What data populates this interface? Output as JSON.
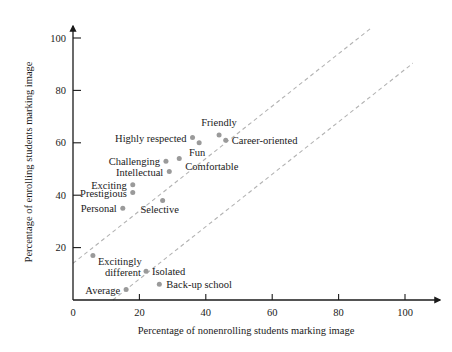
{
  "chart_data": {
    "type": "scatter",
    "title": "",
    "xlabel": "Percentage of nonenrolling students marking image",
    "ylabel": "Percentage of enrolling students marking image",
    "xlim": [
      0,
      100
    ],
    "ylim": [
      0,
      100
    ],
    "xticks": [
      "0",
      "20",
      "40",
      "60",
      "80",
      "100"
    ],
    "yticks": [
      "20",
      "40",
      "60",
      "80",
      "100"
    ],
    "xtick_values": [
      0,
      20,
      40,
      60,
      80,
      100
    ],
    "ytick_values": [
      20,
      40,
      60,
      80,
      100
    ],
    "grid": false,
    "legend": "none",
    "marker_color": "#9a9a9a",
    "reference_line_color": "#b3b3b3",
    "axis_color": "#1a1a1a",
    "points": [
      {
        "label": "Friendly",
        "x": 44,
        "y": 63,
        "label_dx": 0,
        "label_dy": -9,
        "anchor": "middle"
      },
      {
        "label": "Career-oriented",
        "x": 46,
        "y": 61,
        "label_dx": 6,
        "label_dy": 4,
        "anchor": "start"
      },
      {
        "label": "Highly respected",
        "x": 36,
        "y": 62,
        "label_dx": -6,
        "label_dy": 4,
        "anchor": "end"
      },
      {
        "label": "Fun",
        "x": 38,
        "y": 60,
        "label_dx": -2,
        "label_dy": 13,
        "anchor": "middle"
      },
      {
        "label": "Comfortable",
        "x": 32,
        "y": 54,
        "label_dx": 6,
        "label_dy": 11,
        "anchor": "start"
      },
      {
        "label": "Challenging",
        "x": 28,
        "y": 53,
        "label_dx": -6,
        "label_dy": 4,
        "anchor": "end"
      },
      {
        "label": "Intellectual",
        "x": 29,
        "y": 49,
        "label_dx": -6,
        "label_dy": 4,
        "anchor": "end"
      },
      {
        "label": "Exciting",
        "x": 18,
        "y": 44,
        "label_dx": -6,
        "label_dy": 4,
        "anchor": "end"
      },
      {
        "label": "Prestigious",
        "x": 18,
        "y": 41,
        "label_dx": -6,
        "label_dy": 4,
        "anchor": "end"
      },
      {
        "label": "Personal",
        "x": 15,
        "y": 35,
        "label_dx": -6,
        "label_dy": 4,
        "anchor": "end"
      },
      {
        "label": "Selective",
        "x": 27,
        "y": 38,
        "label_dx": -3,
        "label_dy": 13,
        "anchor": "middle"
      },
      {
        "label": "Excitingly",
        "x": 6,
        "y": 17,
        "label_dx": 5,
        "label_dy": 10,
        "anchor": "start"
      },
      {
        "label": "different",
        "x": 6,
        "y": 17,
        "label_dx": 12,
        "label_dy": 21,
        "anchor": "start"
      },
      {
        "label": "Isolated",
        "x": 22,
        "y": 11,
        "label_dx": 6,
        "label_dy": 4,
        "anchor": "start"
      },
      {
        "label": "Back-up school",
        "x": 26,
        "y": 6,
        "label_dx": 7,
        "label_dy": 4,
        "anchor": "start"
      },
      {
        "label": "Average",
        "x": 16,
        "y": 4,
        "label_dx": -6,
        "label_dy": 4,
        "anchor": "end"
      }
    ],
    "reference_lines": [
      {
        "name": "upper-reference-line",
        "x0": 0,
        "y0": 14,
        "x1": 90,
        "y1": 104,
        "style": "dashed"
      },
      {
        "name": "lower-reference-line",
        "x0": 12,
        "y0": 0,
        "x1": 105,
        "y1": 93,
        "style": "dashed"
      }
    ]
  }
}
